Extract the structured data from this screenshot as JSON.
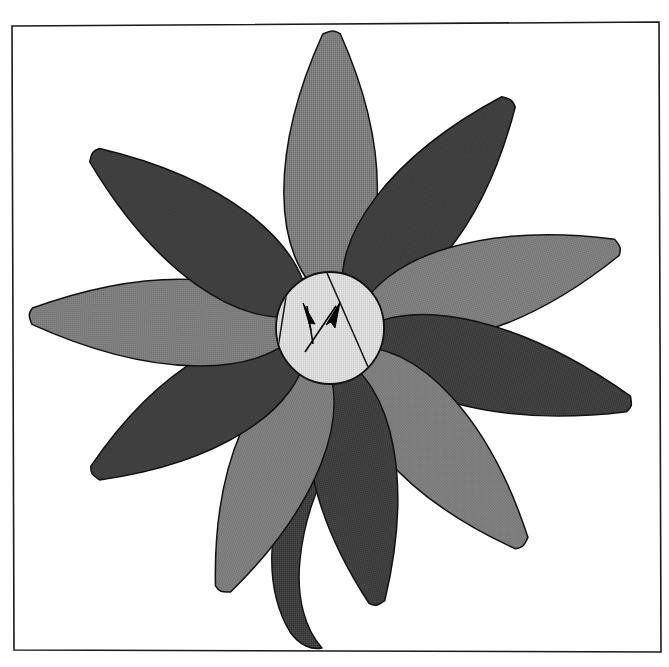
{
  "figure": {
    "title": "Stylised flower diagram with shaded petals and arrow-marked centre disc",
    "canvas": {
      "width": 669,
      "height": 667,
      "background": "#ffffff"
    }
  },
  "frame": {
    "name": "image-border",
    "stroke": "#1a1a1a",
    "stroke_width": 1.6,
    "points": "12,26 659,22 661,652 14,650"
  },
  "palette": {
    "petal_light": "#7d7d7d",
    "petal_dark": "#3f3f3f",
    "disc_fill": "#d9d9d9",
    "outline": "#111111",
    "arrow_fill": "#000000",
    "background": "#ffffff"
  },
  "flower": {
    "center": {
      "x": 330,
      "y": 328
    },
    "disc": {
      "name": "flower-center-disc",
      "cx": 330,
      "cy": 328,
      "rx": 54,
      "ry": 56,
      "fill_key": "disc_fill"
    },
    "disc_chords": [
      {
        "name": "disc-chord-left",
        "x1": 288,
        "y1": 284,
        "x2": 278,
        "y2": 348
      },
      {
        "name": "disc-chord-right",
        "x1": 327,
        "y1": 273,
        "x2": 372,
        "y2": 376
      }
    ],
    "arrows": [
      {
        "name": "arrow-up",
        "label": "arrow pointing up",
        "tail": {
          "x": 313,
          "y": 344
        },
        "tip": {
          "x": 307,
          "y": 306
        },
        "head": "303,303 315,324 309,323 311,330"
      },
      {
        "name": "arrow-up-right",
        "label": "arrow pointing up-right",
        "tail": {
          "x": 305,
          "y": 352
        },
        "tip": {
          "x": 336,
          "y": 306
        },
        "head": "340,302 335,328 331,322 326,325"
      }
    ],
    "petals": [
      {
        "name": "petal-top",
        "angle": -90,
        "length": 268,
        "width": 104,
        "shade": "petal_light"
      },
      {
        "name": "petal-upper-right",
        "angle": -52,
        "length": 262,
        "width": 100,
        "shade": "petal_dark"
      },
      {
        "name": "petal-right-upper",
        "angle": -16,
        "length": 272,
        "width": 100,
        "shade": "petal_light"
      },
      {
        "name": "petal-right",
        "angle": 14,
        "length": 282,
        "width": 94,
        "shade": "petal_dark"
      },
      {
        "name": "petal-lower-right",
        "angle": 48,
        "length": 262,
        "width": 100,
        "shade": "petal_light"
      },
      {
        "name": "petal-bottom",
        "angle": 80,
        "length": 252,
        "width": 94,
        "shade": "petal_dark"
      },
      {
        "name": "petal-lower-left",
        "angle": 112,
        "length": 256,
        "width": 96,
        "shade": "petal_light"
      },
      {
        "name": "petal-left-lower",
        "angle": 148,
        "length": 250,
        "width": 96,
        "shade": "petal_dark"
      },
      {
        "name": "petal-left",
        "angle": 182,
        "length": 272,
        "width": 96,
        "shade": "petal_light"
      },
      {
        "name": "petal-upper-left",
        "angle": 216,
        "length": 266,
        "width": 98,
        "shade": "petal_dark"
      }
    ],
    "stem": {
      "name": "flower-stem",
      "shade": "petal_dark",
      "path": "M 296 455 C 268 520 262 585 290 632 C 300 646 312 650 322 648 C 306 630 296 600 300 560 C 304 520 316 490 330 462 Z"
    }
  }
}
